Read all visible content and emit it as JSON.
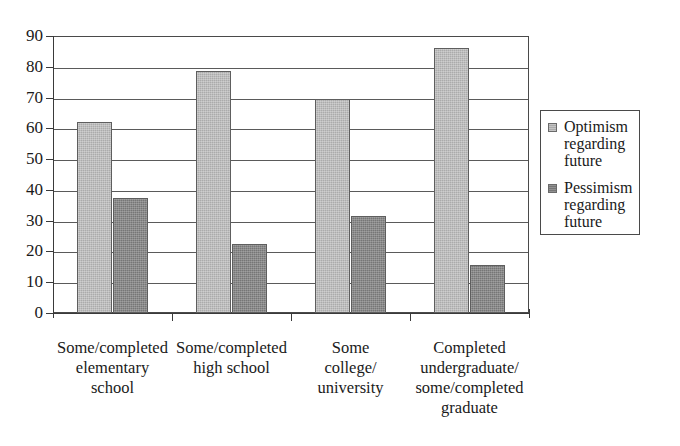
{
  "chart_data": {
    "type": "bar",
    "title": "",
    "subtitle": "",
    "xlabel": "",
    "ylabel": "",
    "ylim": [
      0,
      90
    ],
    "ytick_labels": [
      "0",
      "10",
      "20",
      "30",
      "40",
      "50",
      "60",
      "70",
      "80",
      "90"
    ],
    "ytick_values": [
      0,
      10,
      20,
      30,
      40,
      50,
      60,
      70,
      80,
      90
    ],
    "grid": true,
    "legend_position": "right",
    "categories": [
      "Some/completed\nelementary\nschool",
      "Some/completed\nhigh school",
      "Some\ncollege/\nuniversity",
      "Completed\nundergraduate/\nsome/completed\ngraduate"
    ],
    "series": [
      {
        "name": "Optimism\nregarding\nfuture",
        "color": "#ababab",
        "values": [
          62,
          78.5,
          69.5,
          86
        ]
      },
      {
        "name": "Pessimism\nregarding\nfuture",
        "color": "#767676",
        "values": [
          37.5,
          22.5,
          31.5,
          15.5
        ]
      }
    ]
  },
  "legend": {
    "entries": [
      {
        "label": "Optimism\nregarding\nfuture",
        "swatch": "optimism"
      },
      {
        "label": "Pessimism\nregarding\nfuture",
        "swatch": "pessimism"
      }
    ]
  },
  "colors": {
    "optimism": "#ababab",
    "pessimism": "#767676",
    "axis": "#3a3a3a",
    "grid": "#5a5a5a",
    "background": "#ffffff"
  }
}
